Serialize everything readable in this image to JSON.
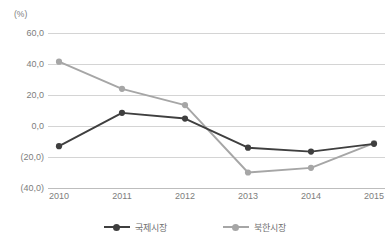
{
  "chart_data": {
    "type": "line",
    "title": "",
    "subtitle": "",
    "unit_label": "(%)",
    "xlabel": "",
    "ylabel": "",
    "categories": [
      "2010",
      "2011",
      "2012",
      "2013",
      "2014",
      "2015"
    ],
    "ylim": [
      -40.0,
      60.0
    ],
    "yticks": [
      60.0,
      40.0,
      20.0,
      0.0,
      -20.0,
      -40.0
    ],
    "ytick_labels": [
      "60,0",
      "40,0",
      "20,0",
      "0,0",
      "(20,0)",
      "(40,0)"
    ],
    "grid": true,
    "legend_position": "bottom",
    "series": [
      {
        "name": "국제시장",
        "color": "#3f3f3f",
        "marker": "circle",
        "values": [
          -13.0,
          8.5,
          4.8,
          -14.0,
          -16.5,
          -11.5
        ]
      },
      {
        "name": "북한시장",
        "color": "#a6a6a6",
        "marker": "circle",
        "values": [
          41.5,
          24.0,
          13.5,
          -30.0,
          -27.0,
          -11.0
        ]
      }
    ]
  },
  "legend": {
    "items": [
      {
        "label": "국제시장",
        "color": "#3f3f3f"
      },
      {
        "label": "북한시장",
        "color": "#a6a6a6"
      }
    ]
  },
  "colors": {
    "series_international": "#3f3f3f",
    "series_north_korea": "#a6a6a6",
    "gridline": "#d4d4d4",
    "axis_text": "#7d7d7d",
    "background": "#ffffff"
  }
}
